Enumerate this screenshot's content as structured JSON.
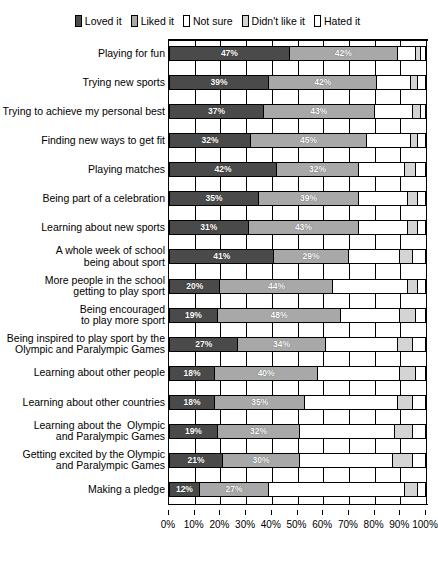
{
  "chart_data": {
    "type": "bar",
    "subtype": "stacked-horizontal-100pct",
    "title": "",
    "xlabel": "",
    "ylabel": "",
    "xlim": [
      0,
      100
    ],
    "xticks": [
      "0%",
      "10%",
      "20%",
      "30%",
      "40%",
      "50%",
      "60%",
      "70%",
      "80%",
      "90%",
      "100%"
    ],
    "grid": true,
    "legend_position": "top-center",
    "series": [
      {
        "name": "Loved it",
        "color": "#4a4a4a"
      },
      {
        "name": "Liked it",
        "color": "#a8a8a8"
      },
      {
        "name": "Not sure",
        "color": "#ffffff"
      },
      {
        "name": "Didn't like it",
        "color": "#d4d4d4"
      },
      {
        "name": "Hated it",
        "color": "#ffffff"
      }
    ],
    "categories": [
      "Playing for fun",
      "Trying new sports",
      "Trying to achieve my personal best",
      "Finding new ways to get fit",
      "Playing matches",
      "Being part of a celebration",
      "Learning about new sports",
      "A whole week of school\nbeing about sport",
      "More people in the school\ngetting to play sport",
      "Being encouraged\nto play more sport",
      "Being inspired to play sport by the\nOlympic and Paralympic Games",
      "Learning about other people",
      "Learning about other countries",
      "Learning about the  Olympic\nand Paralympic Games",
      "Getting excited by the Olympic\nand Paralympic Games",
      "Making a pledge"
    ],
    "rows": [
      {
        "category": "Playing for fun",
        "values": [
          47,
          42,
          7,
          2,
          2
        ],
        "labels": [
          "47%",
          "42%",
          "",
          "",
          ""
        ]
      },
      {
        "category": "Trying new sports",
        "values": [
          39,
          42,
          13,
          3,
          3
        ],
        "labels": [
          "39%",
          "42%",
          "",
          "",
          ""
        ]
      },
      {
        "category": "Trying to achieve my personal best",
        "values": [
          37,
          43,
          15,
          3,
          2
        ],
        "labels": [
          "37%",
          "43%",
          "",
          "",
          ""
        ]
      },
      {
        "category": "Finding new ways to get fit",
        "values": [
          32,
          45,
          17,
          3,
          3
        ],
        "labels": [
          "32%",
          "45%",
          "",
          "",
          ""
        ]
      },
      {
        "category": "Playing matches",
        "values": [
          42,
          32,
          18,
          4,
          4
        ],
        "labels": [
          "42%",
          "32%",
          "",
          "",
          ""
        ]
      },
      {
        "category": "Being part of a celebration",
        "values": [
          35,
          39,
          19,
          4,
          3
        ],
        "labels": [
          "35%",
          "39%",
          "",
          "",
          ""
        ]
      },
      {
        "category": "Learning about new sports",
        "values": [
          31,
          43,
          19,
          4,
          3
        ],
        "labels": [
          "31%",
          "43%",
          "",
          "",
          ""
        ]
      },
      {
        "category": "A whole week of school being about sport",
        "values": [
          41,
          29,
          20,
          5,
          5
        ],
        "labels": [
          "41%",
          "29%",
          "",
          "",
          ""
        ]
      },
      {
        "category": "More people in the school getting to play sport",
        "values": [
          20,
          44,
          29,
          4,
          3
        ],
        "labels": [
          "20%",
          "44%",
          "",
          "",
          ""
        ]
      },
      {
        "category": "Being encouraged to play more sport",
        "values": [
          19,
          48,
          23,
          6,
          4
        ],
        "labels": [
          "19%",
          "48%",
          "",
          "",
          ""
        ]
      },
      {
        "category": "Being inspired to play sport by the Olympic and Paralympic Games",
        "values": [
          27,
          34,
          28,
          6,
          5
        ],
        "labels": [
          "27%",
          "34%",
          "",
          "",
          ""
        ]
      },
      {
        "category": "Learning about other people",
        "values": [
          18,
          40,
          32,
          6,
          4
        ],
        "labels": [
          "18%",
          "40%",
          "",
          "",
          ""
        ]
      },
      {
        "category": "Learning about other countries",
        "values": [
          18,
          35,
          36,
          6,
          5
        ],
        "labels": [
          "18%",
          "35%",
          "",
          "",
          ""
        ]
      },
      {
        "category": "Learning about the  Olympic and Paralympic Games",
        "values": [
          19,
          32,
          37,
          7,
          5
        ],
        "labels": [
          "19%",
          "32%",
          "",
          "",
          ""
        ]
      },
      {
        "category": "Getting excited by the Olympic and Paralympic Games",
        "values": [
          21,
          30,
          36,
          8,
          5
        ],
        "labels": [
          "21%",
          "30%",
          "",
          "",
          ""
        ]
      },
      {
        "category": "Making a pledge",
        "values": [
          12,
          27,
          53,
          5,
          3
        ],
        "labels": [
          "12%",
          "27%",
          "",
          "",
          ""
        ]
      }
    ]
  },
  "legend": {
    "items": [
      {
        "label": "Loved it",
        "color": "#4a4a4a"
      },
      {
        "label": "Liked it",
        "color": "#a8a8a8"
      },
      {
        "label": "Not sure",
        "color": "#ffffff"
      },
      {
        "label": "Didn't like it",
        "color": "#d4d4d4"
      },
      {
        "label": "Hated it",
        "color": "#ffffff"
      }
    ]
  }
}
